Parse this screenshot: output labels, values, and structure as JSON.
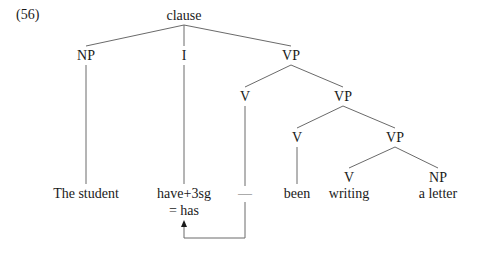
{
  "example_number": "(56)",
  "tree": {
    "root": "clause",
    "level1": {
      "np": "NP",
      "infl": "I",
      "vp": "VP"
    },
    "level2": {
      "v": "V",
      "vp": "VP"
    },
    "level3": {
      "v": "V",
      "vp": "VP"
    },
    "level4": {
      "v": "V",
      "np": "NP"
    }
  },
  "leaves": {
    "subject": "The student",
    "infl_line1": "have+3sg",
    "infl_line2": "= has",
    "trace": "—",
    "been": "been",
    "writing": "writing",
    "object": "a letter"
  },
  "movement_arrow": {
    "from": "trace",
    "to": "infl",
    "description": "head movement of V to I"
  }
}
